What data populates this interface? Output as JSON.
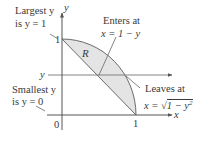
{
  "diagram": {
    "axes": {
      "x_label": "x",
      "y_label": "y",
      "origin_label": "0",
      "x_tick": "1",
      "y_tick": "1"
    },
    "region_label": "R",
    "horizontal_line_label": "y",
    "annotations": {
      "largest": {
        "line1": "Largest y",
        "line2": "is y = 1"
      },
      "smallest": {
        "line1": "Smallest y",
        "line2": "is y = 0"
      },
      "enters": {
        "line1": "Enters at",
        "line2": "x = 1 − y"
      },
      "leaves": {
        "line1": "Leaves at",
        "line2_prefix": "x = ",
        "line2_radical": "1 − y",
        "line2_exp": "2"
      }
    },
    "colors": {
      "region_fill": "#e4e4e4",
      "axis": "#555555",
      "curve": "#6a6a6a",
      "text": "#3a3a3a"
    }
  }
}
